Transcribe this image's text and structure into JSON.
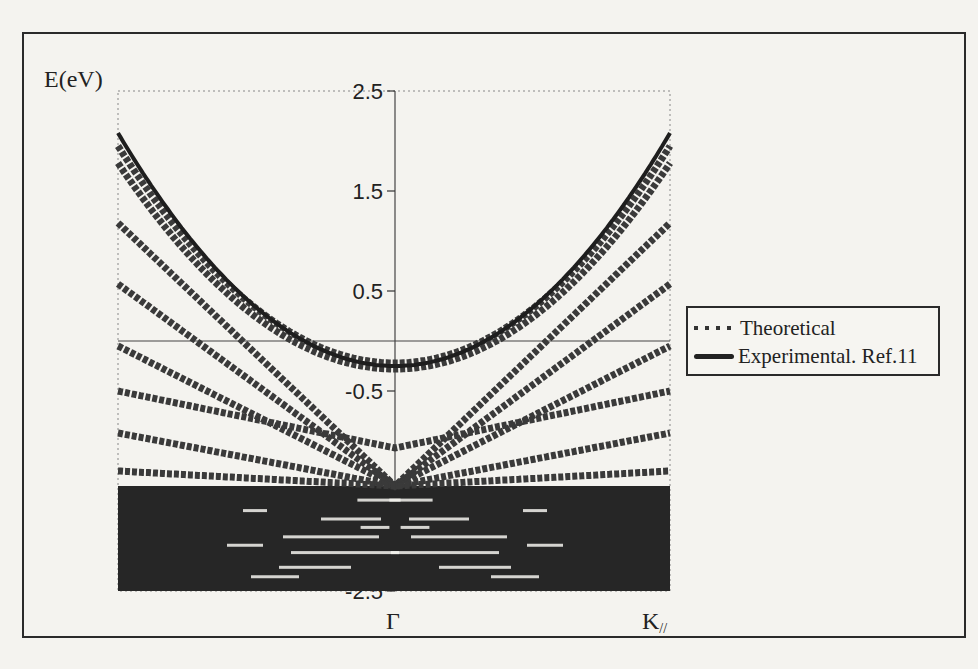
{
  "figure": {
    "y_axis_label": "E(eV)",
    "x_labels": {
      "gamma": "Γ",
      "k_parallel": "K//"
    },
    "legend": {
      "theoretical": "Theoretical",
      "experimental": "Experimental. Ref.11"
    }
  },
  "chart_data": {
    "type": "line",
    "title": "",
    "xlabel": "k (Γ at centre, K// at edges)",
    "ylabel": "E(eV)",
    "ylim": [
      -2.5,
      2.5
    ],
    "xlim": [
      -1,
      1
    ],
    "y_ticks": [
      2.5,
      1.5,
      0.5,
      -0.5,
      -1.5,
      -2.5
    ],
    "x_tick_labels": [
      {
        "x": 0,
        "label": "Γ"
      },
      {
        "x": 1,
        "label": "K//"
      }
    ],
    "grid": false,
    "reference_lines": [
      {
        "orientation": "horizontal",
        "y": 0
      },
      {
        "orientation": "vertical",
        "x": 0
      }
    ],
    "legend_position": "right-middle",
    "series": [
      {
        "name": "Experimental. Ref.11",
        "style": "solid",
        "shape": "parabola",
        "E_at_gamma": -0.25,
        "E_at_edge": 2.08
      },
      {
        "name": "Theoretical",
        "style": "markers",
        "bands": [
          {
            "shape": "parabola",
            "E_at_gamma": -0.22,
            "E_at_edge": 1.95
          },
          {
            "shape": "parabola",
            "E_at_gamma": -0.28,
            "E_at_edge": 1.78
          },
          {
            "shape": "V",
            "E_at_gamma": -1.45,
            "E_at_edge": 1.18
          },
          {
            "shape": "V",
            "E_at_gamma": -1.45,
            "E_at_edge": 0.57
          },
          {
            "shape": "V",
            "E_at_gamma": -1.45,
            "E_at_edge": -0.05
          },
          {
            "shape": "V",
            "E_at_gamma": -1.07,
            "E_at_edge": -0.5
          },
          {
            "shape": "V",
            "E_at_gamma": -1.45,
            "E_at_edge": -0.92
          },
          {
            "shape": "V",
            "E_at_gamma": -1.45,
            "E_at_edge": -1.3
          },
          {
            "shape": "dense",
            "E_range": [
              -2.5,
              -1.45
            ]
          }
        ]
      }
    ]
  }
}
